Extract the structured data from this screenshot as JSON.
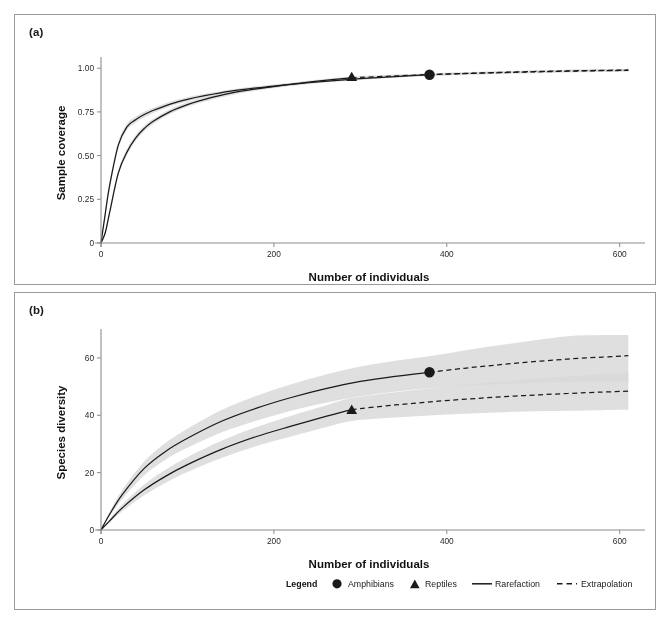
{
  "figure": {
    "panel_a_label": "(a)",
    "panel_b_label": "(b)",
    "bleed_text": ""
  },
  "legend": {
    "title": "Legend",
    "entries": [
      {
        "label": "Amphibians",
        "marker": "circle-marker-icon"
      },
      {
        "label": "Reptiles",
        "marker": "triangle-marker-icon"
      },
      {
        "label": "Rarefaction",
        "marker": "solid-line-icon"
      },
      {
        "label": "Extrapolation",
        "marker": "dashed-line-icon"
      }
    ]
  },
  "chart_data": [
    {
      "type": "line",
      "panel": "(a)",
      "title": "",
      "xlabel": "Number of individuals",
      "ylabel": "Sample coverage",
      "xlim": [
        0,
        620
      ],
      "ylim": [
        0,
        1.03
      ],
      "xticks": [
        0,
        200,
        400,
        600
      ],
      "xticklabels": [
        "0",
        "200",
        "400",
        "600"
      ],
      "yticks": [
        0,
        0.25,
        0.5,
        0.75,
        1.0
      ],
      "yticklabels": [
        "0",
        "0.25",
        "0.50",
        "0.75",
        "1.00"
      ],
      "grid": false,
      "legend_position": "below-panel-b",
      "series": [
        {
          "name": "Amphibians",
          "marker": "circle",
          "reference_sample_size": 380,
          "reference_value": 0.963,
          "rarefaction_x": [
            0,
            5,
            10,
            20,
            30,
            40,
            50,
            60,
            80,
            100,
            120,
            150,
            180,
            210,
            240,
            270,
            300,
            330,
            360,
            380
          ],
          "rarefaction_y": [
            0.0,
            0.17,
            0.33,
            0.56,
            0.665,
            0.705,
            0.735,
            0.758,
            0.795,
            0.822,
            0.843,
            0.869,
            0.888,
            0.903,
            0.917,
            0.929,
            0.94,
            0.949,
            0.958,
            0.963
          ],
          "extrapolation_x": [
            380,
            420,
            460,
            500,
            540,
            580,
            610
          ],
          "extrapolation_y": [
            0.963,
            0.97,
            0.976,
            0.981,
            0.985,
            0.988,
            0.99
          ],
          "ci_halfwidth_rarefaction": [
            0.0,
            0.02,
            0.022,
            0.02,
            0.018,
            0.017,
            0.016,
            0.015,
            0.013,
            0.012,
            0.011,
            0.01,
            0.009,
            0.008,
            0.008,
            0.007,
            0.007,
            0.006,
            0.006,
            0.006
          ],
          "ci_halfwidth_extrapolation": [
            0.006,
            0.006,
            0.006,
            0.006,
            0.006,
            0.006,
            0.006
          ]
        },
        {
          "name": "Reptiles",
          "marker": "triangle",
          "reference_sample_size": 290,
          "reference_value": 0.952,
          "rarefaction_x": [
            0,
            5,
            10,
            20,
            30,
            40,
            50,
            60,
            80,
            100,
            120,
            150,
            180,
            210,
            240,
            270,
            290
          ],
          "rarefaction_y": [
            0.0,
            0.06,
            0.175,
            0.4,
            0.52,
            0.6,
            0.655,
            0.695,
            0.752,
            0.792,
            0.822,
            0.857,
            0.882,
            0.902,
            0.92,
            0.936,
            0.945
          ],
          "extrapolation_x": [
            290,
            340,
            390,
            440,
            490,
            540,
            580,
            610
          ],
          "extrapolation_y": [
            0.945,
            0.956,
            0.965,
            0.972,
            0.978,
            0.983,
            0.986,
            0.988
          ],
          "ci_halfwidth_rarefaction": [
            0.0,
            0.012,
            0.016,
            0.018,
            0.018,
            0.017,
            0.016,
            0.015,
            0.014,
            0.013,
            0.012,
            0.011,
            0.01,
            0.009,
            0.008,
            0.008,
            0.008
          ],
          "ci_halfwidth_extrapolation": [
            0.008,
            0.008,
            0.008,
            0.008,
            0.008,
            0.008,
            0.008,
            0.008
          ]
        }
      ]
    },
    {
      "type": "line",
      "panel": "(b)",
      "title": "",
      "xlabel": "Number of individuals",
      "ylabel": "Species diversity",
      "xlim": [
        0,
        620
      ],
      "ylim": [
        0,
        68
      ],
      "xticks": [
        0,
        200,
        400,
        600
      ],
      "xticklabels": [
        "0",
        "200",
        "400",
        "600"
      ],
      "yticks": [
        0,
        20,
        40,
        60
      ],
      "yticklabels": [
        "0",
        "20",
        "40",
        "60"
      ],
      "grid": false,
      "legend_position": "below",
      "series": [
        {
          "name": "Amphibians",
          "marker": "circle",
          "reference_sample_size": 380,
          "reference_value": 55,
          "rarefaction_x": [
            0,
            10,
            25,
            50,
            75,
            100,
            140,
            180,
            220,
            260,
            300,
            340,
            380
          ],
          "rarefaction_y": [
            0,
            5.5,
            12.5,
            21.5,
            27.5,
            32.0,
            38.0,
            42.5,
            46.2,
            49.3,
            51.8,
            53.6,
            55.0
          ],
          "extrapolation_x": [
            380,
            420,
            460,
            500,
            540,
            580,
            610
          ],
          "extrapolation_y": [
            55.0,
            56.4,
            57.6,
            58.7,
            59.6,
            60.3,
            60.8
          ],
          "ci_halfwidth_rarefaction": [
            0,
            0.8,
            1.6,
            2.4,
            2.9,
            3.3,
            3.9,
            4.3,
            4.6,
            4.9,
            5.2,
            5.4,
            5.6
          ],
          "ci_halfwidth_extrapolation": [
            5.6,
            6.2,
            6.8,
            7.4,
            8.0,
            8.6,
            9.1
          ]
        },
        {
          "name": "Reptiles",
          "marker": "triangle",
          "reference_sample_size": 290,
          "reference_value": 42,
          "rarefaction_x": [
            0,
            10,
            25,
            50,
            75,
            100,
            140,
            180,
            220,
            260,
            290
          ],
          "rarefaction_y": [
            0,
            3.2,
            7.8,
            14.0,
            18.8,
            22.8,
            28.2,
            32.6,
            36.2,
            39.6,
            42.0
          ],
          "extrapolation_x": [
            290,
            340,
            390,
            440,
            490,
            540,
            580,
            610
          ],
          "extrapolation_y": [
            42.0,
            43.6,
            44.9,
            46.0,
            46.9,
            47.6,
            48.1,
            48.4
          ],
          "ci_halfwidth_rarefaction": [
            0,
            0.6,
            1.2,
            1.9,
            2.3,
            2.6,
            3.0,
            3.3,
            3.6,
            3.8,
            4.0
          ],
          "ci_halfwidth_extrapolation": [
            4.0,
            4.4,
            4.8,
            5.2,
            5.6,
            6.0,
            6.3,
            6.5
          ]
        }
      ]
    }
  ],
  "colors": {
    "line": "#1a1a1a",
    "ci_band": "#d9d9d9",
    "ci_band_overlap": "#b9b9b9",
    "axis": "#8c8c8c",
    "panel_border": "#9a9a9a",
    "text": "#111111"
  }
}
